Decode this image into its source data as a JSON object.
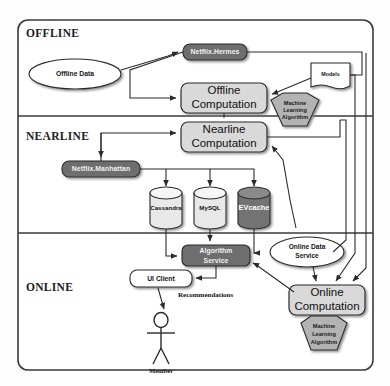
{
  "diagram": {
    "tiers": [
      {
        "id": "offline",
        "label": "OFFLINE"
      },
      {
        "id": "nearline",
        "label": "NEARLINE"
      },
      {
        "id": "online",
        "label": "ONLINE"
      }
    ],
    "colors": {
      "dark_fill": "#6e6e6e",
      "light_fill": "#d9d9d9",
      "white_fill": "#ffffff",
      "hex_fill": "#b3b3b3",
      "db_dark_fill": "#737373",
      "stroke": "#2b2b2b",
      "frame": "#3a3a3a"
    },
    "nodes": {
      "offline_data": "Offline Data",
      "netflix_hermes": "Netflix.Hermes",
      "offline_computation_line1": "Offline",
      "offline_computation_line2": "Computation",
      "models": "Models",
      "ml_offline_line1": "Machine",
      "ml_offline_line2": "Learning",
      "ml_offline_line3": "Algorithm",
      "nearline_computation_line1": "Nearline",
      "nearline_computation_line2": "Computation",
      "netflix_manhattan": "Netflix.Manhattan",
      "db_cassandra": "Cassandra",
      "db_mysql": "MySQL",
      "db_evcache": "EVcache",
      "algorithm_service_line1": "Algorithm",
      "algorithm_service_line2": "Service",
      "ui_client": "UI Client",
      "online_data_service_line1": "Online Data",
      "online_data_service_line2": "Service",
      "online_computation_line1": "Online",
      "online_computation_line2": "Computation",
      "ml_online_line1": "Machine",
      "ml_online_line2": "Learning",
      "ml_online_line3": "Algorithm",
      "member": "Member"
    },
    "edge_labels": {
      "recommendations": "Recommendations"
    }
  }
}
